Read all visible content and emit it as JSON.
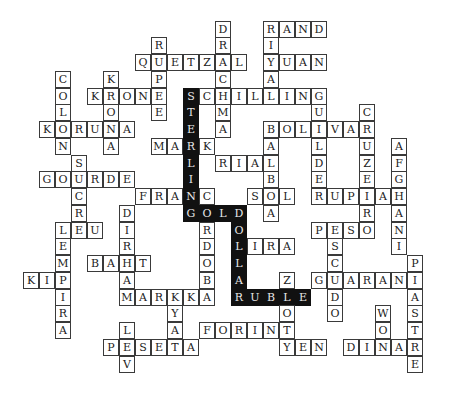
{
  "puzzle": {
    "title": "",
    "grid": {
      "col_pitch": 16,
      "row_pitch": 16.75,
      "x0": 7,
      "y0": 20.6
    },
    "colors": {
      "line": "#3a3a3a",
      "highlight_fill": "#111111",
      "highlight_text": "#e8e8e8",
      "background": "#ffffff"
    },
    "words": [
      {
        "word": "RAND",
        "row": 0,
        "col": 16,
        "dir": "across"
      },
      {
        "word": "RIYAL",
        "row": 0,
        "col": 16,
        "dir": "down"
      },
      {
        "word": "YUAN",
        "row": 2,
        "col": 16,
        "dir": "across"
      },
      {
        "word": "DRACHMA",
        "row": 0,
        "col": 13,
        "dir": "down"
      },
      {
        "word": "QUETZAL",
        "row": 2,
        "col": 8,
        "dir": "across"
      },
      {
        "word": "RUPEE",
        "row": 1,
        "col": 9,
        "dir": "down"
      },
      {
        "word": "KRONE",
        "row": 4,
        "col": 5,
        "dir": "across"
      },
      {
        "word": "KRONA",
        "row": 3,
        "col": 6,
        "dir": "down"
      },
      {
        "word": "KORUNA",
        "row": 6,
        "col": 2,
        "dir": "across"
      },
      {
        "word": "COLON",
        "row": 3,
        "col": 3,
        "dir": "down"
      },
      {
        "word": "SCHILLING",
        "row": 4,
        "col": 11,
        "dir": "across"
      },
      {
        "word": "MARK",
        "row": 7,
        "col": 9,
        "dir": "across"
      },
      {
        "word": "RIAL",
        "row": 8,
        "col": 13,
        "dir": "across"
      },
      {
        "word": "BOLIVAR",
        "row": 6,
        "col": 16,
        "dir": "across"
      },
      {
        "word": "BALBOA",
        "row": 6,
        "col": 16,
        "dir": "down"
      },
      {
        "word": "SOL",
        "row": 10,
        "col": 15,
        "dir": "across"
      },
      {
        "word": "GUILDER",
        "row": 4,
        "col": 19,
        "dir": "down"
      },
      {
        "word": "CRUZEIRO",
        "row": 5,
        "col": 22,
        "dir": "down"
      },
      {
        "word": "RUPIAH",
        "row": 10,
        "col": 19,
        "dir": "across"
      },
      {
        "word": "AFGHANI",
        "row": 7,
        "col": 24,
        "dir": "down"
      },
      {
        "word": "PESO",
        "row": 12,
        "col": 19,
        "dir": "across"
      },
      {
        "word": "ESCUDO",
        "row": 12,
        "col": 20,
        "dir": "down"
      },
      {
        "word": "GUARANI",
        "row": 15,
        "col": 19,
        "dir": "across"
      },
      {
        "word": "PIASTRE",
        "row": 14,
        "col": 25,
        "dir": "down"
      },
      {
        "word": "WON",
        "row": 17,
        "col": 23,
        "dir": "down"
      },
      {
        "word": "DINAR",
        "row": 19,
        "col": 21,
        "dir": "across"
      },
      {
        "word": "S",
        "row": 8,
        "col": 4,
        "dir": "down"
      },
      {
        "word": "GOURDE",
        "row": 9,
        "col": 2,
        "dir": "across"
      },
      {
        "word": "SUCRE",
        "row": 8,
        "col": 4,
        "dir": "down"
      },
      {
        "word": "LEU",
        "row": 12,
        "col": 3,
        "dir": "across"
      },
      {
        "word": "LEMPIRA",
        "row": 12,
        "col": 3,
        "dir": "down"
      },
      {
        "word": "KIP",
        "row": 15,
        "col": 1,
        "dir": "across"
      },
      {
        "word": "FRANC",
        "row": 10,
        "col": 8,
        "dir": "across"
      },
      {
        "word": "CORDOBA",
        "row": 10,
        "col": 12,
        "dir": "down"
      },
      {
        "word": "DIRHAM",
        "row": 11,
        "col": 7,
        "dir": "down"
      },
      {
        "word": "BAHT",
        "row": 14,
        "col": 5,
        "dir": "across"
      },
      {
        "word": "MARKKA",
        "row": 16,
        "col": 7,
        "dir": "across"
      },
      {
        "word": "KYAT",
        "row": 16,
        "col": 10,
        "dir": "down"
      },
      {
        "word": "PESETA",
        "row": 19,
        "col": 6,
        "dir": "across"
      },
      {
        "word": "LEV",
        "row": 18,
        "col": 7,
        "dir": "down"
      },
      {
        "word": "FORINT",
        "row": 18,
        "col": 12,
        "dir": "across"
      },
      {
        "word": "LIRA",
        "row": 13,
        "col": 14,
        "dir": "across"
      },
      {
        "word": "ZLOTY",
        "row": 15,
        "col": 17,
        "dir": "down"
      },
      {
        "word": "YEN",
        "row": 19,
        "col": 17,
        "dir": "across"
      },
      {
        "word": "STERLING",
        "row": 4,
        "col": 11,
        "dir": "down",
        "highlight": true
      },
      {
        "word": "GOLD",
        "row": 11,
        "col": 11,
        "dir": "across",
        "highlight": true
      },
      {
        "word": "DOLLAR",
        "row": 11,
        "col": 14,
        "dir": "down",
        "highlight": true
      },
      {
        "word": "RUBLE",
        "row": 16,
        "col": 14,
        "dir": "across",
        "highlight": true
      }
    ]
  }
}
